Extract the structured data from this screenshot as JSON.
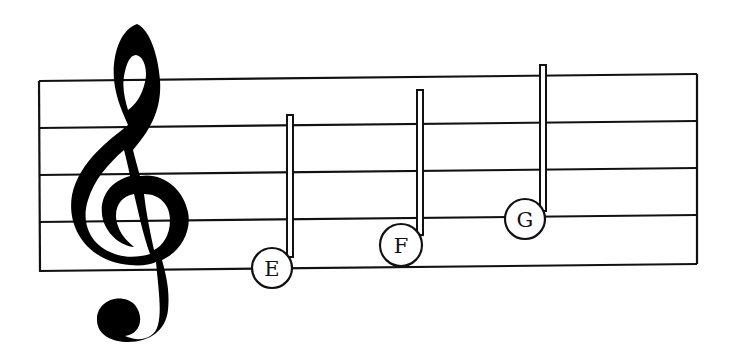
{
  "diagram": {
    "clef": "treble-clef",
    "notes": [
      {
        "label": "E",
        "position": "first line"
      },
      {
        "label": "F",
        "position": "first space"
      },
      {
        "label": "G",
        "position": "second line"
      }
    ],
    "colors": {
      "ink": "#111111",
      "background": "#ffffff"
    }
  }
}
